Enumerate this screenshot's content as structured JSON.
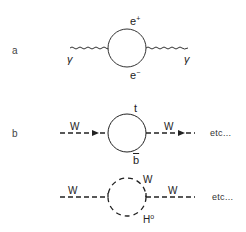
{
  "diagram": {
    "panels": [
      {
        "id": "a",
        "label": "a",
        "incoming": "γ",
        "outgoing": "γ",
        "loop_top": {
          "base": "e",
          "sup": "+"
        },
        "loop_bottom": {
          "base": "e",
          "sup": "−"
        },
        "line_style": "wavy",
        "loop_style": "solid"
      },
      {
        "id": "b",
        "label": "b",
        "incoming": "W",
        "outgoing": "W",
        "loop_top": "t",
        "loop_bottom": "b",
        "loop_bottom_bar": true,
        "line_style": "dashed-arrow",
        "loop_style": "solid",
        "trailing": "etc..."
      },
      {
        "id": "c",
        "label": "",
        "incoming": "W",
        "outgoing": "W",
        "loop_top": "W",
        "loop_bottom": {
          "base": "H",
          "sup": "o"
        },
        "line_style": "dashed",
        "loop_style": "dashed",
        "trailing": "etc..."
      }
    ]
  }
}
